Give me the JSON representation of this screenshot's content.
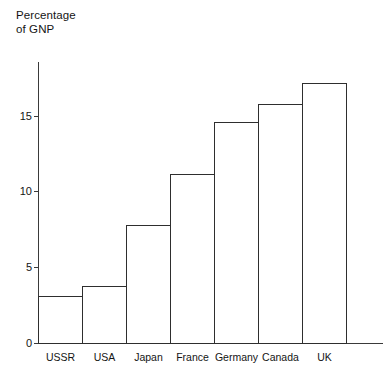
{
  "chart_data": {
    "type": "bar",
    "title": "",
    "ylabel": "Percentage\nof GNP",
    "xlabel": "",
    "categories": [
      "USSR",
      "USA",
      "Japan",
      "France",
      "Germany",
      "Canada",
      "UK"
    ],
    "values": [
      3.1,
      3.8,
      7.8,
      11.2,
      14.6,
      15.8,
      17.2
    ],
    "ylim": [
      0,
      18.6
    ],
    "yticks": [
      0,
      5,
      10,
      15
    ],
    "ytick_labels": [
      "0",
      "5",
      "10",
      "15"
    ],
    "grid": false,
    "legend": false,
    "bar_fill_color": "#ffffff",
    "bar_edge_color": "#2e2e2e",
    "axis_color": "#3a3a3a",
    "background_color": "#ffffff"
  }
}
